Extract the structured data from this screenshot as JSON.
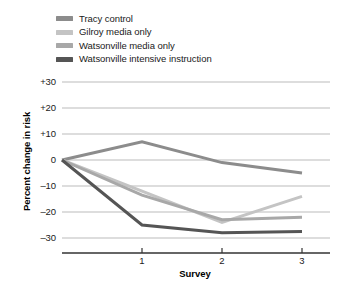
{
  "chart_data": {
    "type": "line",
    "title": "",
    "xlabel": "Survey",
    "ylabel": "Percent change in risk",
    "x": [
      0,
      1,
      2,
      3
    ],
    "xtick_labels": [
      "1",
      "2",
      "3"
    ],
    "xtick_values": [
      1,
      2,
      3
    ],
    "ytick_labels": [
      "+30",
      "+20",
      "+10",
      "0",
      "–10",
      "–20",
      "–30"
    ],
    "ytick_values": [
      30,
      20,
      10,
      0,
      -10,
      -20,
      -30
    ],
    "ylim": [
      -34,
      32
    ],
    "xlim": [
      0,
      3.35
    ],
    "grid": "horizontal",
    "legend_position": "top-left",
    "series": [
      {
        "name": "Tracy control",
        "color": "#8c8c8c",
        "values": [
          0,
          7,
          -1,
          -5
        ]
      },
      {
        "name": "Gilroy media only",
        "color": "#c4c4c4",
        "values": [
          0,
          -12,
          -24,
          -14
        ]
      },
      {
        "name": "Watsonville media only",
        "color": "#a8a8a8",
        "values": [
          0,
          -13.5,
          -23,
          -22
        ]
      },
      {
        "name": "Watsonville intensive instruction",
        "color": "#555555",
        "values": [
          0,
          -25,
          -28,
          -27.5
        ]
      }
    ]
  },
  "legend": {
    "items": [
      {
        "label": "Tracy control",
        "color": "#8c8c8c"
      },
      {
        "label": "Gilroy media only",
        "color": "#c4c4c4"
      },
      {
        "label": "Watsonville media only",
        "color": "#a8a8a8"
      },
      {
        "label": "Watsonville intensive instruction",
        "color": "#555555"
      }
    ]
  },
  "axes": {
    "y_title": "Percent change in risk",
    "x_title": "Survey",
    "y_ticks": [
      "+30",
      "+20",
      "+10",
      "0",
      "–10",
      "–20",
      "–30"
    ],
    "x_ticks": [
      "1",
      "2",
      "3"
    ]
  },
  "caption": {
    "text": ""
  },
  "colors": {
    "gridline": "#aaaaaa",
    "axis": "#333333",
    "text": "#1a1a1a"
  }
}
